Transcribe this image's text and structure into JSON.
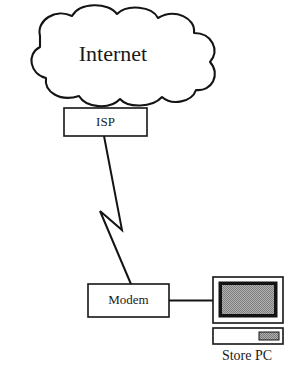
{
  "diagram": {
    "background_color": "#ffffff",
    "line_color": "#141414",
    "screen_color": "#9a9a9a",
    "nodes": {
      "cloud": {
        "label": "Internet",
        "shape": "cloud"
      },
      "isp": {
        "label": "ISP",
        "shape": "rectangle"
      },
      "modem": {
        "label": "Modem",
        "shape": "rectangle"
      },
      "store_pc": {
        "label": "Store PC",
        "shape": "desktop-computer"
      }
    },
    "connections": [
      {
        "from": "cloud",
        "to": "isp",
        "style": "attached"
      },
      {
        "from": "isp",
        "to": "modem",
        "style": "lightning-bolt"
      },
      {
        "from": "modem",
        "to": "store_pc",
        "style": "straight-line"
      }
    ]
  }
}
